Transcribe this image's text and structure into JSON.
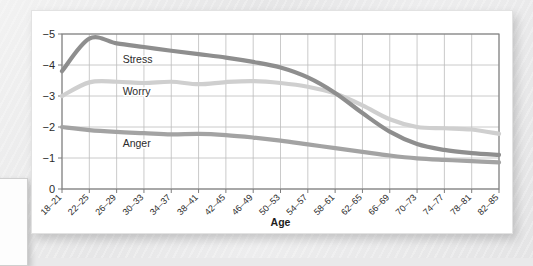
{
  "figure": {
    "background_color": "#ffffff",
    "page_color": "#e9e9ea"
  },
  "chart_data": {
    "type": "line",
    "title": "",
    "xlabel": "Age",
    "ylabel": "",
    "grid": true,
    "legend": "inline-labels",
    "ylim": [
      0,
      5
    ],
    "yticks": [
      "0",
      "1",
      "2",
      "3",
      "4",
      "5"
    ],
    "ytick_labels_rendered": [
      "−5",
      "−4",
      "−3",
      "−2",
      "−1",
      "0"
    ],
    "categories": [
      "18–21",
      "22–25",
      "26–29",
      "30–33",
      "34–37",
      "38–41",
      "42–45",
      "46–49",
      "50–53",
      "54–57",
      "58–61",
      "62–65",
      "66–69",
      "70–73",
      "74–77",
      "78–81",
      "82–85"
    ],
    "series": [
      {
        "name": "Stress",
        "color": "#8e8e8e",
        "label_x_category": "26–29",
        "values": [
          3.8,
          4.85,
          4.7,
          4.58,
          4.46,
          4.35,
          4.24,
          4.1,
          3.92,
          3.6,
          3.1,
          2.45,
          1.85,
          1.45,
          1.26,
          1.16,
          1.1
        ]
      },
      {
        "name": "Worry",
        "color": "#cfcfcf",
        "label_x_category": "26–29",
        "values": [
          3.0,
          3.44,
          3.46,
          3.42,
          3.46,
          3.38,
          3.45,
          3.48,
          3.42,
          3.3,
          3.08,
          2.7,
          2.25,
          2.0,
          1.96,
          1.92,
          1.78
        ]
      },
      {
        "name": "Anger",
        "color": "#a3a3a3",
        "label_x_category": "26–29",
        "values": [
          2.0,
          1.9,
          1.84,
          1.8,
          1.76,
          1.78,
          1.74,
          1.66,
          1.56,
          1.44,
          1.32,
          1.2,
          1.08,
          0.99,
          0.94,
          0.9,
          0.86
        ]
      }
    ]
  }
}
